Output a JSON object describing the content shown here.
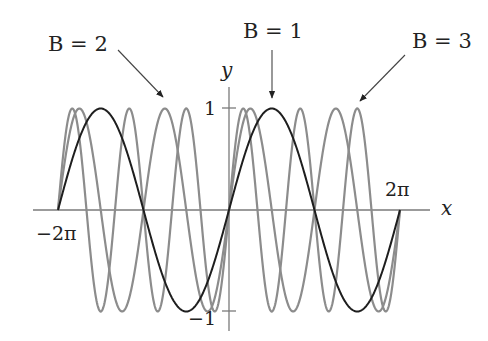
{
  "chart_data": {
    "type": "line",
    "title": "",
    "xlabel": "x",
    "ylabel": "y",
    "xlim": [
      -6.2832,
      6.2832
    ],
    "ylim": [
      -1,
      1
    ],
    "x_tick_labels": [
      "-2π",
      "2π"
    ],
    "y_tick_labels": [
      "1",
      "-1"
    ],
    "grid": false,
    "legend": "none (annotated with arrows)",
    "function": "y = sin(Bx)",
    "series": [
      {
        "name": "B = 1",
        "B": 1,
        "color": "#1e1e1e"
      },
      {
        "name": "B = 2",
        "B": 2,
        "color": "#8c8c8c"
      },
      {
        "name": "B = 3",
        "B": 3,
        "color": "#8c8c8c"
      }
    ],
    "annotations": [
      {
        "text": "B = 2",
        "arrow_to": "peak of B=2 curve near x=-3π/4"
      },
      {
        "text": "B = 1",
        "arrow_to": "peak of B=1 curve at x=π/2"
      },
      {
        "text": "B = 3",
        "arrow_to": "peak of B=3 curve near x=3π/2"
      }
    ]
  },
  "labels": {
    "y_axis": "y",
    "x_axis": "x",
    "y_one": "1",
    "y_neg_one": "−1",
    "x_neg_two_pi": "−2π",
    "x_two_pi": "2π",
    "ann_b2": "B = 2",
    "ann_b1": "B = 1",
    "ann_b3": "B = 3"
  },
  "colors": {
    "axis": "#7a7a7a",
    "black_curve": "#1e1e1e",
    "gray_curve": "#8c8c8c"
  }
}
